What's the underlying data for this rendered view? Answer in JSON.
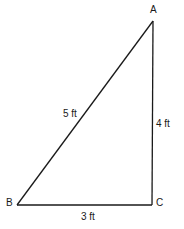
{
  "diagram": {
    "type": "right-triangle",
    "vertices": {
      "A": {
        "label": "A"
      },
      "B": {
        "label": "B"
      },
      "C": {
        "label": "C"
      }
    },
    "sides": {
      "AB": {
        "label": "5 ft"
      },
      "AC": {
        "label": "4 ft"
      },
      "BC": {
        "label": "3 ft"
      }
    },
    "colors": {
      "line": "#1a1a1a",
      "background": "#ffffff"
    }
  }
}
